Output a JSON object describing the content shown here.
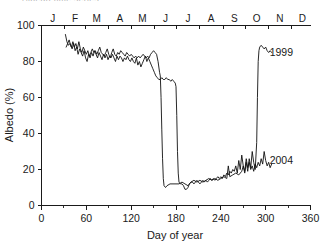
{
  "figure": {
    "clipped_header_text": "Albedo time series",
    "series_labels": {
      "s1999": "1999",
      "s2004": "2004"
    }
  },
  "chart_data": {
    "type": "line",
    "title": "",
    "xlabel": "Day of year",
    "ylabel": "Albedo (%)",
    "xlim": [
      0,
      360
    ],
    "ylim": [
      0,
      100
    ],
    "xticks": [
      0,
      60,
      120,
      180,
      240,
      300,
      360
    ],
    "xticklabels": [
      "0",
      "60",
      "120",
      "180",
      "240",
      "300",
      "360"
    ],
    "xminorticks": [
      30,
      90,
      150,
      210,
      270,
      330
    ],
    "yticks": [
      0,
      20,
      40,
      60,
      80,
      100
    ],
    "yticklabels": [
      "0",
      "20",
      "40",
      "60",
      "80",
      "100"
    ],
    "grid": false,
    "legend_position": "inline-right-of-curve",
    "secondary_axis": {
      "position": "top",
      "label": "month",
      "tick_boundaries": [
        0,
        31,
        59,
        90,
        120,
        151,
        181,
        212,
        243,
        273,
        304,
        334,
        365
      ],
      "categories": [
        "J",
        "F",
        "M",
        "A",
        "M",
        "J",
        "J",
        "A",
        "S",
        "O",
        "N",
        "D"
      ],
      "category_centers": [
        15,
        45,
        74,
        105,
        135,
        166,
        196,
        227,
        258,
        288,
        319,
        349
      ]
    },
    "series": [
      {
        "name": "1999",
        "label_x": 300,
        "label_y": 85,
        "points": [
          [
            32,
            95
          ],
          [
            34,
            91
          ],
          [
            36,
            89
          ],
          [
            38,
            90
          ],
          [
            40,
            88
          ],
          [
            42,
            91
          ],
          [
            44,
            88
          ],
          [
            46,
            90
          ],
          [
            48,
            87
          ],
          [
            50,
            91
          ],
          [
            52,
            87
          ],
          [
            54,
            85
          ],
          [
            56,
            88
          ],
          [
            58,
            86
          ],
          [
            60,
            84
          ],
          [
            62,
            86
          ],
          [
            64,
            83
          ],
          [
            66,
            85
          ],
          [
            68,
            87
          ],
          [
            70,
            85
          ],
          [
            72,
            86
          ],
          [
            74,
            84
          ],
          [
            76,
            86
          ],
          [
            78,
            88
          ],
          [
            80,
            85
          ],
          [
            82,
            84
          ],
          [
            84,
            83
          ],
          [
            86,
            85
          ],
          [
            88,
            87
          ],
          [
            90,
            84
          ],
          [
            92,
            82
          ],
          [
            94,
            85
          ],
          [
            96,
            87
          ],
          [
            98,
            84
          ],
          [
            100,
            83
          ],
          [
            102,
            85
          ],
          [
            104,
            84
          ],
          [
            106,
            86
          ],
          [
            108,
            85
          ],
          [
            110,
            84
          ],
          [
            112,
            83
          ],
          [
            114,
            85
          ],
          [
            116,
            84
          ],
          [
            118,
            83
          ],
          [
            120,
            84
          ],
          [
            122,
            83
          ],
          [
            124,
            82
          ],
          [
            126,
            83
          ],
          [
            128,
            82
          ],
          [
            130,
            83
          ],
          [
            132,
            82
          ],
          [
            134,
            83
          ],
          [
            136,
            84
          ],
          [
            138,
            83
          ],
          [
            140,
            82
          ],
          [
            142,
            83
          ],
          [
            144,
            82
          ],
          [
            146,
            84
          ],
          [
            148,
            85
          ],
          [
            150,
            86
          ],
          [
            152,
            85
          ],
          [
            154,
            84
          ],
          [
            156,
            80
          ],
          [
            158,
            74
          ],
          [
            159,
            72
          ],
          [
            160,
            60
          ],
          [
            161,
            42
          ],
          [
            162,
            26
          ],
          [
            163,
            15
          ],
          [
            164,
            11
          ],
          [
            166,
            10
          ],
          [
            168,
            11
          ],
          [
            172,
            12
          ],
          [
            176,
            12
          ],
          [
            180,
            12
          ],
          [
            184,
            12
          ],
          [
            188,
            13
          ],
          [
            192,
            12
          ],
          [
            196,
            11
          ],
          [
            200,
            13
          ],
          [
            204,
            14
          ],
          [
            208,
            13
          ],
          [
            212,
            14
          ],
          [
            216,
            13
          ],
          [
            220,
            14
          ],
          [
            224,
            15
          ],
          [
            228,
            14
          ],
          [
            232,
            15
          ],
          [
            236,
            14
          ],
          [
            240,
            15
          ],
          [
            244,
            16
          ],
          [
            248,
            15
          ],
          [
            250,
            22
          ],
          [
            252,
            16
          ],
          [
            256,
            17
          ],
          [
            260,
            18
          ],
          [
            264,
            17
          ],
          [
            268,
            19
          ],
          [
            270,
            22
          ],
          [
            272,
            18
          ],
          [
            274,
            24
          ],
          [
            276,
            19
          ],
          [
            278,
            26
          ],
          [
            280,
            21
          ],
          [
            282,
            30
          ],
          [
            284,
            24
          ],
          [
            286,
            20
          ],
          [
            288,
            35
          ],
          [
            289,
            60
          ],
          [
            290,
            80
          ],
          [
            291,
            86
          ],
          [
            292,
            88
          ],
          [
            294,
            89
          ],
          [
            296,
            88
          ],
          [
            298,
            87
          ],
          [
            300,
            88
          ],
          [
            302,
            86
          ],
          [
            304,
            85
          ],
          [
            306,
            86
          ],
          [
            308,
            85
          ]
        ]
      },
      {
        "name": "2004",
        "label_x": 300,
        "label_y": 25,
        "points": [
          [
            33,
            88
          ],
          [
            35,
            90
          ],
          [
            37,
            92
          ],
          [
            39,
            89
          ],
          [
            41,
            87
          ],
          [
            43,
            90
          ],
          [
            45,
            86
          ],
          [
            47,
            88
          ],
          [
            49,
            84
          ],
          [
            51,
            87
          ],
          [
            53,
            85
          ],
          [
            55,
            83
          ],
          [
            57,
            86
          ],
          [
            59,
            82
          ],
          [
            61,
            80
          ],
          [
            63,
            84
          ],
          [
            65,
            82
          ],
          [
            67,
            85
          ],
          [
            69,
            83
          ],
          [
            71,
            86
          ],
          [
            73,
            84
          ],
          [
            75,
            82
          ],
          [
            77,
            85
          ],
          [
            79,
            83
          ],
          [
            81,
            81
          ],
          [
            83,
            84
          ],
          [
            85,
            82
          ],
          [
            87,
            84
          ],
          [
            89,
            81
          ],
          [
            91,
            83
          ],
          [
            93,
            82
          ],
          [
            95,
            84
          ],
          [
            97,
            82
          ],
          [
            99,
            80
          ],
          [
            101,
            83
          ],
          [
            103,
            81
          ],
          [
            105,
            83
          ],
          [
            107,
            82
          ],
          [
            109,
            80
          ],
          [
            111,
            82
          ],
          [
            113,
            81
          ],
          [
            115,
            83
          ],
          [
            117,
            81
          ],
          [
            119,
            80
          ],
          [
            121,
            82
          ],
          [
            123,
            80
          ],
          [
            125,
            79
          ],
          [
            127,
            82
          ],
          [
            129,
            78
          ],
          [
            131,
            80
          ],
          [
            133,
            77
          ],
          [
            135,
            79
          ],
          [
            137,
            81
          ],
          [
            139,
            83
          ],
          [
            141,
            80
          ],
          [
            143,
            82
          ],
          [
            145,
            80
          ],
          [
            147,
            78
          ],
          [
            149,
            76
          ],
          [
            151,
            74
          ],
          [
            153,
            72
          ],
          [
            155,
            71
          ],
          [
            157,
            70
          ],
          [
            159,
            70
          ],
          [
            161,
            71
          ],
          [
            163,
            70
          ],
          [
            165,
            70
          ],
          [
            167,
            71
          ],
          [
            169,
            70
          ],
          [
            171,
            70
          ],
          [
            173,
            69
          ],
          [
            175,
            70
          ],
          [
            177,
            69
          ],
          [
            179,
            68
          ],
          [
            180,
            66
          ],
          [
            181,
            50
          ],
          [
            182,
            30
          ],
          [
            183,
            18
          ],
          [
            184,
            13
          ],
          [
            186,
            12
          ],
          [
            188,
            12
          ],
          [
            190,
            11
          ],
          [
            192,
            9
          ],
          [
            194,
            9
          ],
          [
            196,
            10
          ],
          [
            198,
            12
          ],
          [
            200,
            13
          ],
          [
            202,
            13
          ],
          [
            204,
            12
          ],
          [
            206,
            13
          ],
          [
            208,
            14
          ],
          [
            210,
            13
          ],
          [
            212,
            12
          ],
          [
            214,
            13
          ],
          [
            216,
            14
          ],
          [
            218,
            13
          ],
          [
            220,
            14
          ],
          [
            222,
            13
          ],
          [
            224,
            14
          ],
          [
            226,
            15
          ],
          [
            228,
            14
          ],
          [
            230,
            15
          ],
          [
            232,
            14
          ],
          [
            234,
            15
          ],
          [
            236,
            16
          ],
          [
            238,
            15
          ],
          [
            240,
            16
          ],
          [
            242,
            15
          ],
          [
            244,
            17
          ],
          [
            246,
            16
          ],
          [
            248,
            18
          ],
          [
            250,
            17
          ],
          [
            252,
            19
          ],
          [
            254,
            18
          ],
          [
            256,
            20
          ],
          [
            258,
            19
          ],
          [
            260,
            22
          ],
          [
            262,
            18
          ],
          [
            264,
            25
          ],
          [
            266,
            20
          ],
          [
            268,
            28
          ],
          [
            270,
            22
          ],
          [
            272,
            19
          ],
          [
            274,
            26
          ],
          [
            276,
            21
          ],
          [
            278,
            24
          ],
          [
            280,
            20
          ],
          [
            282,
            22
          ],
          [
            284,
            19
          ],
          [
            286,
            23
          ],
          [
            288,
            21
          ],
          [
            290,
            24
          ],
          [
            292,
            22
          ],
          [
            294,
            26
          ],
          [
            296,
            23
          ],
          [
            298,
            30
          ],
          [
            300,
            25
          ],
          [
            302,
            22
          ],
          [
            304,
            24
          ],
          [
            306,
            21
          ],
          [
            308,
            23
          ]
        ]
      }
    ]
  }
}
